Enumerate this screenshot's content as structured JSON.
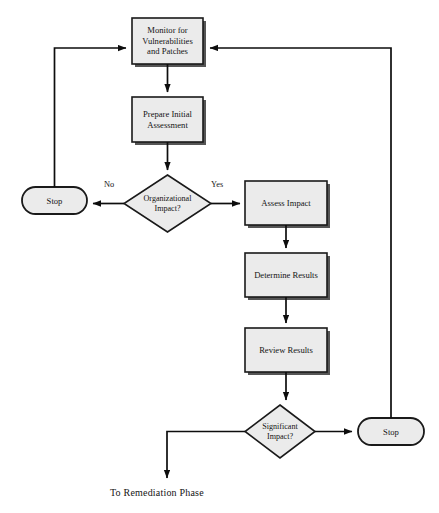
{
  "diagram": {
    "caption": "To Remediation Phase",
    "colors": {
      "node_fill": "#ebebeb",
      "node_stroke": "#1a1a1a",
      "shadow": "#555555",
      "line": "#0d0d0d",
      "text": "#141414",
      "background": "#ffffff"
    },
    "nodes": [
      {
        "id": "monitor",
        "type": "process",
        "label": "Monitor for\nVulnerabilities\nand Patches",
        "x": 132,
        "y": 18,
        "w": 71,
        "h": 46
      },
      {
        "id": "prepare",
        "type": "process",
        "label": "Prepare Initial\nAssessment",
        "x": 132,
        "y": 97,
        "w": 71,
        "h": 45
      },
      {
        "id": "orgimpact",
        "type": "decision",
        "label": "Organizational\nImpact?",
        "x": 124,
        "y": 175,
        "w": 87,
        "h": 57
      },
      {
        "id": "stopleft",
        "type": "terminator",
        "label": "Stop",
        "x": 22,
        "y": 187,
        "w": 65,
        "h": 27
      },
      {
        "id": "assess",
        "type": "process",
        "label": "Assess Impact",
        "x": 245,
        "y": 181,
        "w": 82,
        "h": 44
      },
      {
        "id": "determine",
        "type": "process",
        "label": "Determine Results",
        "x": 245,
        "y": 253,
        "w": 82,
        "h": 44
      },
      {
        "id": "review",
        "type": "process",
        "label": "Review Results",
        "x": 245,
        "y": 328,
        "w": 82,
        "h": 44
      },
      {
        "id": "sigimpact",
        "type": "decision",
        "label": "Significant\nImpact?",
        "x": 245,
        "y": 405,
        "w": 70,
        "h": 53
      },
      {
        "id": "stopright",
        "type": "terminator",
        "label": "Stop",
        "x": 358,
        "y": 418,
        "w": 66,
        "h": 27
      }
    ],
    "edge_labels": [
      {
        "id": "no-branch",
        "text": "No",
        "x": 104,
        "y": 180
      },
      {
        "id": "yes-branch",
        "text": "Yes",
        "x": 211,
        "y": 180
      }
    ]
  }
}
